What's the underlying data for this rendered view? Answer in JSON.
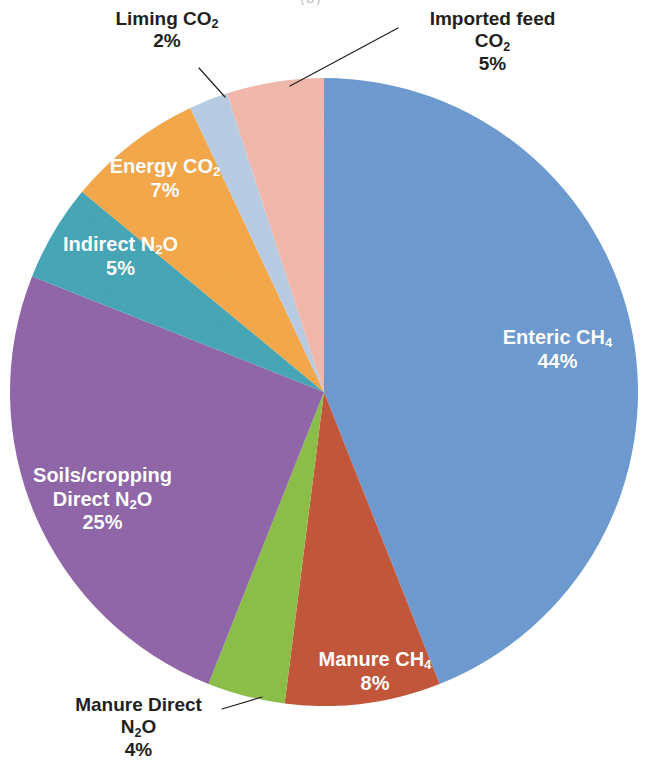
{
  "caption": "(b)",
  "chart_data": {
    "type": "pie",
    "title": "",
    "subtitle": "",
    "xlabel": "",
    "ylabel": "",
    "units": "percent",
    "legend": "none",
    "grid": false,
    "value_suffix": "%",
    "start_angle_deg": 0,
    "direction": "clockwise",
    "categories": [
      "Enteric CH4",
      "Manure CH4",
      "Manure Direct N2O",
      "Soils/cropping Direct N2O",
      "Indirect N2O",
      "Energy CO2",
      "Liming CO2",
      "Imported feed CO2"
    ],
    "values": [
      44,
      8,
      4,
      25,
      5,
      7,
      2,
      5
    ],
    "colors": [
      "#6e9bd1",
      "#c4573c",
      "#8dc049",
      "#9167a9",
      "#47a7b7",
      "#f5a94b",
      "#b9cde5",
      "#f3b9ad"
    ],
    "slices": [
      {
        "key": "enteric",
        "label_lines": [
          "Enteric CH",
          "44%"
        ],
        "sub": "4",
        "value": 44,
        "value_text": "44%",
        "color": "#6e9bd1",
        "label_position": "inside",
        "label_color": "#ffffff",
        "leader_line": false
      },
      {
        "key": "manure_ch4",
        "label_lines": [
          "Manure CH",
          "8%"
        ],
        "sub": "4",
        "value": 8,
        "value_text": "8%",
        "color": "#c4573c",
        "label_position": "inside",
        "label_color": "#ffffff",
        "leader_line": false
      },
      {
        "key": "manure_direct",
        "label_lines": [
          "Manure Direct",
          "N",
          "4%"
        ],
        "sub": "2",
        "value": 4,
        "value_text": "4%",
        "color": "#8dc049",
        "label_position": "outside",
        "label_color": "#231f20",
        "leader_line": true
      },
      {
        "key": "soils",
        "label_lines": [
          "Soils/cropping",
          "Direct N",
          "25%"
        ],
        "sub": "2",
        "value": 25,
        "value_text": "25%",
        "color": "#9167a9",
        "label_position": "inside",
        "label_color": "#ffffff",
        "leader_line": false
      },
      {
        "key": "indirect",
        "label_lines": [
          "Indirect N",
          "5%"
        ],
        "sub": "2",
        "value": 5,
        "value_text": "5%",
        "color": "#47a7b7",
        "label_position": "inside",
        "label_color": "#ffffff",
        "leader_line": false
      },
      {
        "key": "energy",
        "label_lines": [
          "Energy CO",
          "7%"
        ],
        "sub": "2",
        "value": 7,
        "value_text": "7%",
        "color": "#f5a94b",
        "label_position": "inside",
        "label_color": "#ffffff",
        "leader_line": false
      },
      {
        "key": "liming",
        "label_lines": [
          "Liming CO",
          "2%"
        ],
        "sub": "2",
        "value": 2,
        "value_text": "2%",
        "color": "#b9cde5",
        "label_position": "outside",
        "label_color": "#231f20",
        "leader_line": true
      },
      {
        "key": "imported",
        "label_lines": [
          "Imported feed",
          "CO",
          "5%"
        ],
        "sub": "2",
        "value": 5,
        "value_text": "5%",
        "color": "#f3b9ad",
        "label_position": "outside",
        "label_color": "#231f20",
        "leader_line": true
      }
    ]
  },
  "labels": {
    "enteric": {
      "l1": "Enteric CH",
      "sub": "4",
      "l2": "44%"
    },
    "manure_ch4": {
      "l1": "Manure CH",
      "sub": "4",
      "l2": "8%"
    },
    "manure_direct": {
      "l1": "Manure Direct",
      "l2a": "N",
      "sub": "2",
      "l2b": "O",
      "l3": "4%"
    },
    "soils": {
      "l1": "Soils/cropping",
      "l2a": "Direct N",
      "sub": "2",
      "l2b": "O",
      "l3": "25%"
    },
    "indirect": {
      "l1a": "Indirect N",
      "sub": "2",
      "l1b": "O",
      "l2": "5%"
    },
    "energy": {
      "l1": "Energy CO",
      "sub": "2",
      "l2": "7%"
    },
    "liming": {
      "l1": "Liming CO",
      "sub": "2",
      "l2": "2%"
    },
    "imported": {
      "l1": "Imported feed",
      "l2": "CO",
      "sub": "2",
      "l3": "5%"
    }
  }
}
